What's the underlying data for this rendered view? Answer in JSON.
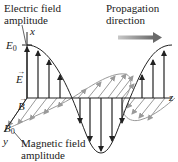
{
  "diagram": {
    "labels": {
      "electric_amplitude_line1": "Electric field",
      "electric_amplitude_line2": "amplitude",
      "propagation_line1": "Propagation",
      "propagation_line2": "direction",
      "magnetic_amplitude_line1": "Magnetic field",
      "magnetic_amplitude_line2": "amplitude"
    },
    "axes": {
      "x": "x",
      "y": "y",
      "z": "z"
    },
    "symbols": {
      "E0_base": "E",
      "E0_sub": "0",
      "B0_base": "B",
      "B0_sub": "0",
      "E_vector": "E",
      "B_vector": "B",
      "vector_arrow": "→"
    },
    "colors": {
      "electric_field": "#222222",
      "magnetic_field": "#9a9a9a",
      "propagation_arrow": "#7a7a7a",
      "text": "#222222"
    },
    "icons": {
      "propagation": "arrow-right-icon"
    }
  }
}
